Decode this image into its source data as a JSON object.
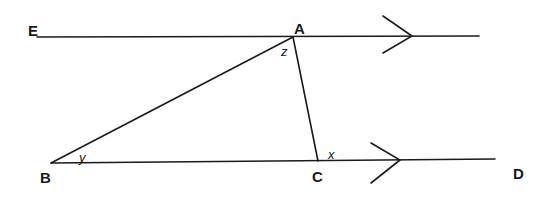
{
  "diagram": {
    "type": "geometry-parallel-lines-triangle",
    "points": {
      "E": {
        "label": "E",
        "x": 37,
        "y": 37
      },
      "A": {
        "label": "A",
        "x": 293,
        "y": 37
      },
      "B": {
        "label": "B",
        "x": 51,
        "y": 163
      },
      "C": {
        "label": "C",
        "x": 318,
        "y": 161
      },
      "D": {
        "label": "D",
        "x": 495,
        "y": 159
      }
    },
    "angles": {
      "z": {
        "label": "z",
        "at": "A"
      },
      "y": {
        "label": "y",
        "at": "B"
      },
      "x": {
        "label": "x",
        "at": "C"
      }
    },
    "lines": [
      {
        "name": "line-EA",
        "from": "E",
        "to": "A-extended",
        "parallel_arrow": true
      },
      {
        "name": "line-BD",
        "from": "B",
        "to": "D",
        "parallel_arrow": true
      },
      {
        "name": "segment-AB",
        "from": "A",
        "to": "B"
      },
      {
        "name": "segment-AC",
        "from": "A",
        "to": "C"
      }
    ],
    "stroke_color": "#1a1a1a",
    "background": "#ffffff"
  }
}
